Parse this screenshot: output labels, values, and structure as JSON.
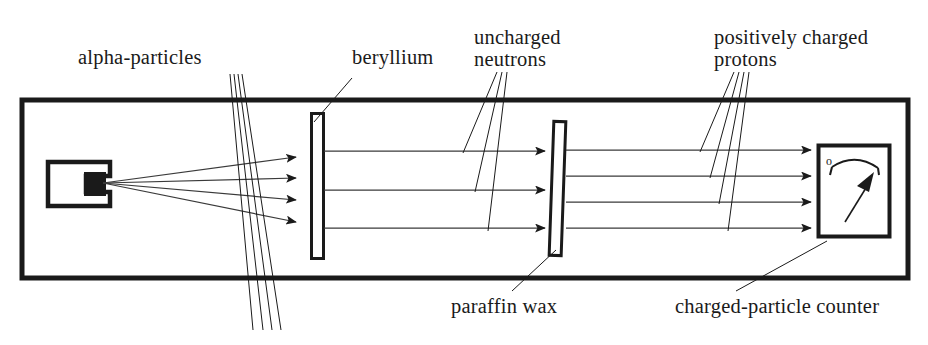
{
  "figure": {
    "width": 928,
    "height": 345,
    "background_color": "#ffffff",
    "ink_color": "#1a1a1a",
    "ray_color": "#3a3a3a"
  },
  "labels": {
    "alpha_particles": "alpha-particles",
    "beryllium": "beryllium",
    "uncharged_neutrons": "uncharged\nneutrons",
    "positively_charged_protons": "positively charged\nprotons",
    "paraffin_wax": "paraffin wax",
    "charged_particle_counter": "charged-particle counter"
  },
  "components": {
    "enclosure": {
      "name": "evacuated chamber",
      "x": 22,
      "y": 100,
      "width": 886,
      "height": 178,
      "stroke_width": 5
    },
    "alpha_source": {
      "name": "polonium alpha source holder",
      "x": 48,
      "y": 162,
      "width": 62,
      "height": 44,
      "emission_point_x": 103,
      "emission_point_y": 183
    },
    "beryllium_plate": {
      "name": "beryllium target",
      "x": 311,
      "y": 113,
      "width": 13,
      "height": 146
    },
    "paraffin_plate": {
      "name": "paraffin wax block",
      "x": 551,
      "y": 121,
      "width": 13,
      "height": 135,
      "tilt_degrees": 2
    },
    "counter": {
      "name": "charged-particle counter meter",
      "x": 818,
      "y": 145,
      "width": 72,
      "height": 92,
      "zero_mark": "o"
    }
  },
  "beams": {
    "alpha_rays": {
      "count": 4,
      "origin": [
        103,
        183
      ],
      "target_x": 300,
      "target_ys": [
        157,
        178,
        200,
        222
      ],
      "arrowheads": true
    },
    "neutron_rays": {
      "count": 3,
      "start_x": 324,
      "end_x": 548,
      "ys": [
        151,
        190,
        228
      ],
      "arrowheads": true
    },
    "proton_rays": {
      "count": 4,
      "start_x": 566,
      "end_x": 814,
      "ys": [
        150,
        176,
        202,
        228
      ],
      "arrowheads": true
    }
  },
  "leaders": {
    "alpha": {
      "from": [
        232,
        74
      ],
      "to": [
        [
          252,
          330
        ],
        [
          262,
          330
        ],
        [
          270,
          330
        ],
        [
          278,
          330
        ]
      ]
    },
    "beryllium": {
      "from": [
        352,
        78
      ],
      "to": [
        316,
        118
      ]
    },
    "neutrons": {
      "from": [
        500,
        74
      ],
      "to": [
        [
          463,
          153
        ],
        [
          475,
          192
        ],
        [
          488,
          230
        ]
      ]
    },
    "protons": {
      "from": [
        738,
        74
      ],
      "to": [
        [
          700,
          152
        ],
        [
          710,
          178
        ],
        [
          720,
          204
        ],
        [
          730,
          230
        ]
      ]
    },
    "paraffin": {
      "from": [
        512,
        290
      ],
      "to": [
        556,
        252
      ]
    },
    "counter": {
      "from": [
        736,
        290
      ],
      "to": [
        826,
        240
      ]
    }
  }
}
